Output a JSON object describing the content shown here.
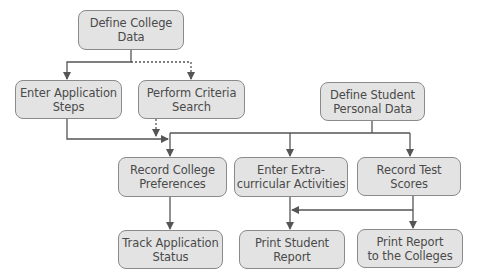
{
  "diagram": {
    "colors": {
      "box_fill": "#e3e3e3",
      "box_border": "#8a8a8a",
      "text": "#4a4a4a",
      "line": "#555555"
    },
    "nodes": [
      {
        "id": "define-college-data",
        "line1": "Define College",
        "line2": "Data"
      },
      {
        "id": "enter-application-steps",
        "line1": "Enter Application",
        "line2": "Steps"
      },
      {
        "id": "perform-criteria-search",
        "line1": "Perform Criteria",
        "line2": "Search"
      },
      {
        "id": "define-student-personal-data",
        "line1": "Define Student",
        "line2": "Personal Data"
      },
      {
        "id": "record-college-preferences",
        "line1": "Record College",
        "line2": "Preferences"
      },
      {
        "id": "enter-extracurricular-activities",
        "line1": "Enter Extra-",
        "line2": "curricular Activities"
      },
      {
        "id": "record-test-scores",
        "line1": "Record Test",
        "line2": "Scores"
      },
      {
        "id": "track-application-status",
        "line1": "Track Application",
        "line2": "Status"
      },
      {
        "id": "print-student-report",
        "line1": "Print Student",
        "line2": "Report"
      },
      {
        "id": "print-report-to-colleges",
        "line1": "Print Report",
        "line2": "to the Colleges"
      }
    ],
    "edges": [
      {
        "from": "define-college-data",
        "to": "enter-application-steps",
        "style": "solid"
      },
      {
        "from": "define-college-data",
        "to": "perform-criteria-search",
        "style": "dotted"
      },
      {
        "from": "enter-application-steps",
        "to": "record-college-preferences",
        "style": "solid"
      },
      {
        "from": "perform-criteria-search",
        "to": "record-college-preferences",
        "style": "dotted"
      },
      {
        "from": "define-student-personal-data",
        "to": "record-college-preferences",
        "style": "solid"
      },
      {
        "from": "define-student-personal-data",
        "to": "enter-extracurricular-activities",
        "style": "solid"
      },
      {
        "from": "define-student-personal-data",
        "to": "record-test-scores",
        "style": "solid"
      },
      {
        "from": "record-college-preferences",
        "to": "track-application-status",
        "style": "solid"
      },
      {
        "from": "enter-extracurricular-activities",
        "to": "print-student-report",
        "style": "solid"
      },
      {
        "from": "record-test-scores",
        "to": "print-student-report",
        "style": "solid"
      },
      {
        "from": "record-test-scores",
        "to": "print-report-to-colleges",
        "style": "solid"
      }
    ]
  }
}
